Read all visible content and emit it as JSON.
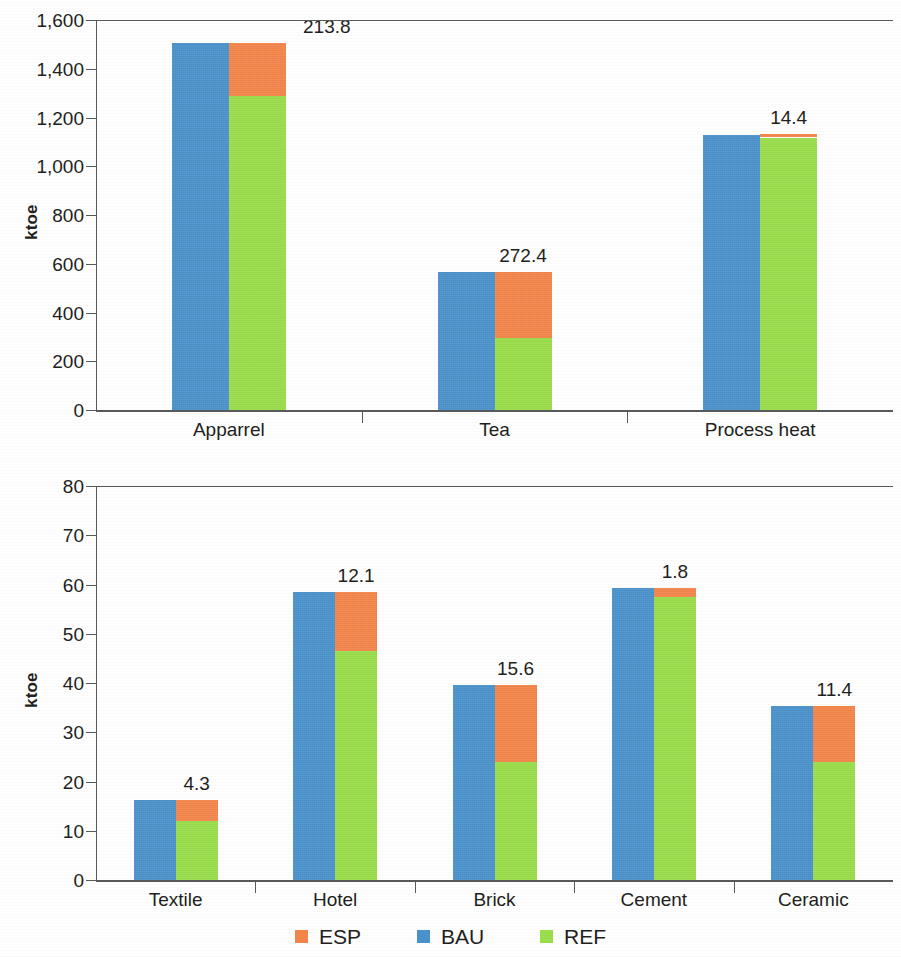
{
  "legend": {
    "items": [
      {
        "label": "ESP",
        "color": "#f4854a",
        "key": "esp"
      },
      {
        "label": "BAU",
        "color": "#4a92cc",
        "key": "bau"
      },
      {
        "label": "REF",
        "color": "#9ade4a",
        "key": "ref"
      }
    ]
  },
  "colors": {
    "esp": "#f4854a",
    "bau": "#4a92cc",
    "ref": "#9ade4a",
    "axis": "#58595b",
    "text": "#231f20",
    "background": "#ffffff"
  },
  "chart_data": [
    {
      "type": "bar",
      "id": "top-chart",
      "title": "",
      "subtitle": "",
      "xlabel": "",
      "ylabel": "ktoe",
      "ylim": [
        0,
        1600
      ],
      "yticks": [
        0,
        200,
        400,
        600,
        800,
        1000,
        1200,
        1400,
        1600
      ],
      "ytick_labels": [
        "0",
        "200",
        "400",
        "600",
        "800",
        "1,000",
        "1,200",
        "1,400",
        "1,600"
      ],
      "grid": false,
      "legend_position": "bottom",
      "stacked": true,
      "categories": [
        "Apparrel",
        "Tea",
        "Process heat"
      ],
      "series": [
        {
          "name": "BAU",
          "values": [
            1503.8,
            565.0,
            1130.0
          ]
        },
        {
          "name": "REF",
          "values": [
            1290.0,
            295.0,
            1118.0
          ]
        },
        {
          "name": "ESP",
          "values": [
            213.8,
            272.4,
            14.4
          ]
        }
      ],
      "annotations": [
        "213.8",
        "272.4",
        "14.4"
      ]
    },
    {
      "type": "bar",
      "id": "bottom-chart",
      "title": "",
      "subtitle": "",
      "xlabel": "",
      "ylabel": "ktoe",
      "ylim": [
        0,
        80
      ],
      "yticks": [
        0,
        10,
        20,
        30,
        40,
        50,
        60,
        70,
        80
      ],
      "ytick_labels": [
        "0",
        "10",
        "20",
        "30",
        "40",
        "50",
        "60",
        "70",
        "80"
      ],
      "grid": false,
      "legend_position": "bottom",
      "stacked": true,
      "categories": [
        "Textile",
        "Hotel",
        "Brick",
        "Cement",
        "Ceramic"
      ],
      "series": [
        {
          "name": "BAU",
          "values": [
            16.3,
            58.5,
            39.6,
            59.3,
            35.4
          ]
        },
        {
          "name": "REF",
          "values": [
            12.0,
            46.4,
            24.0,
            57.5,
            24.0
          ]
        },
        {
          "name": "ESP",
          "values": [
            4.3,
            12.1,
            15.6,
            1.8,
            11.4
          ]
        }
      ],
      "annotations": [
        "4.3",
        "12.1",
        "15.6",
        "1.8",
        "11.4"
      ]
    }
  ]
}
